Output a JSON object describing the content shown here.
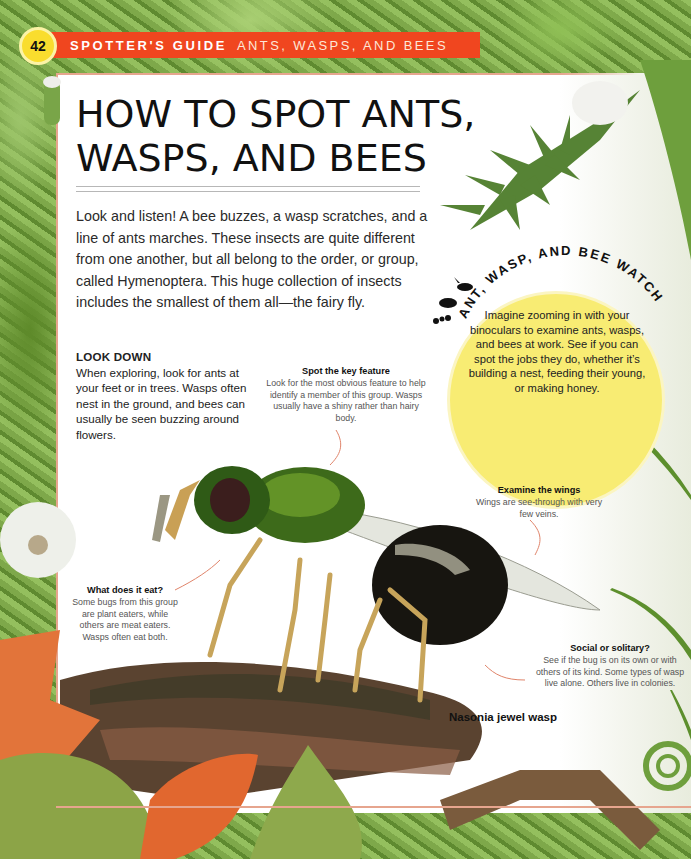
{
  "header": {
    "page_number": "42",
    "section": "SPOTTER'S GUIDE",
    "topic": "ANTS, WASPS, AND BEES"
  },
  "title": {
    "line1": "HOW TO SPOT ANTS,",
    "line2": "WASPS, AND BEES"
  },
  "intro": "Look and listen! A bee buzzes, a wasp scratches, and a line of ants marches. These insects are quite different from one another, but all belong to the order, or group, called Hymenoptera. This huge collection of insects includes the smallest of them all—the fairy fly.",
  "look_down": {
    "heading": "LOOK DOWN",
    "body": "When exploring, look for ants at your feet or in trees. Wasps often nest in the ground, and bees can usually be seen buzzing around flowers."
  },
  "callout": {
    "arc_title": "ANT, WASP, AND BEE WATCH",
    "body": "Imagine zooming in with your binoculars to examine ants, wasps, and bees at work. See if you can spot the jobs they do, whether it’s building a nest, feeding their young, or making honey.",
    "icons": [
      "wasp-icon",
      "bee-icon",
      "ant-icon"
    ]
  },
  "annotations": {
    "key_feature": {
      "heading": "Spot the key feature",
      "body": "Look for the most obvious feature to help identify a member of this group. Wasps usually have a shiny rather than hairy body."
    },
    "wings": {
      "heading": "Examine the wings",
      "body": "Wings are see-through with very few veins."
    },
    "eat": {
      "heading": "What does it eat?",
      "body": "Some bugs from this group are plant eaters, while others are meat eaters. Wasps often eat both."
    },
    "social": {
      "heading": "Social or solitary?",
      "body": "See if the bug is on its own or with others of its kind. Some types of wasp live alone. Others live in colonies."
    }
  },
  "illustration": {
    "caption": "Nasonia jewel wasp"
  },
  "colors": {
    "banner": "#f0461f",
    "badge": "#f9dd2e",
    "callout": "#f8ec73",
    "frame_rule": "#e6a58e",
    "arrow": "#e0846a"
  }
}
